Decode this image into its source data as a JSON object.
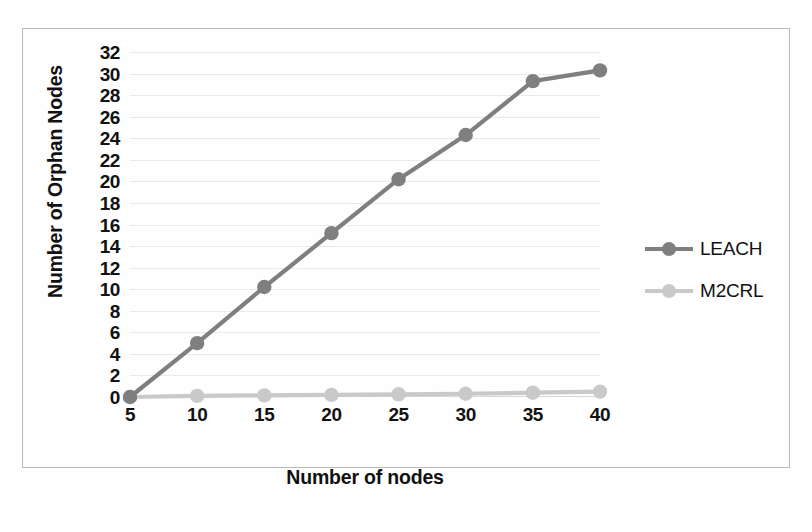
{
  "chart_data": {
    "type": "line",
    "title": "",
    "xlabel": "Number of nodes",
    "ylabel": "Number of Orphan Nodes",
    "x": [
      5,
      10,
      15,
      20,
      25,
      30,
      35,
      40
    ],
    "xticklabels": [
      "5",
      "10",
      "15",
      "20",
      "25",
      "30",
      "35",
      "40"
    ],
    "yticklabels": [
      "32",
      "30",
      "28",
      "26",
      "24",
      "22",
      "20",
      "18",
      "16",
      "14",
      "12",
      "10",
      "8",
      "6",
      "4",
      "2",
      "0"
    ],
    "yticks": [
      32,
      30,
      28,
      26,
      24,
      22,
      20,
      18,
      16,
      14,
      12,
      10,
      8,
      6,
      4,
      2,
      0
    ],
    "xlim": [
      5,
      40
    ],
    "ylim": [
      0,
      32
    ],
    "grid": true,
    "grid_axis": "y",
    "legend_position": "right",
    "series": [
      {
        "name": "LEACH",
        "color": "#7f7f7f",
        "marker": "circle",
        "values": [
          0,
          5.0,
          10.2,
          15.2,
          20.2,
          24.3,
          29.3,
          30.3
        ]
      },
      {
        "name": "M2CRL",
        "color": "#c9c9c9",
        "marker": "circle",
        "values": [
          0,
          0.1,
          0.15,
          0.2,
          0.25,
          0.3,
          0.4,
          0.5
        ]
      }
    ]
  },
  "colors": {
    "leach": "#7f7f7f",
    "m2crl": "#c9c9c9",
    "gridline": "#e9e9ea",
    "frame": "#b9b9b9",
    "text": "#121212"
  }
}
